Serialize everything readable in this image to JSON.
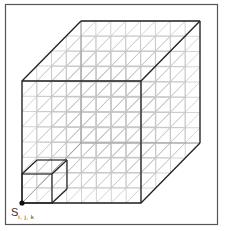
{
  "diagram": {
    "grid": {
      "nx": 8,
      "ny": 8,
      "nz": 4,
      "cell_px": 15
    },
    "outer_cube": {
      "front_face": {
        "x0": 22,
        "y0": 81,
        "x1": 141,
        "y1": 203
      },
      "depth_offset": {
        "dx": 59,
        "dy": -60
      }
    },
    "highlighted_cell": {
      "front_face": {
        "x0": 22,
        "y0": 174,
        "x1": 52,
        "y1": 203
      },
      "depth_offset": {
        "dx": 15,
        "dy": -14
      }
    },
    "origin_point": {
      "x": 22,
      "y": 203
    },
    "label": {
      "main": "S",
      "subscript": "i, j, k"
    },
    "colors": {
      "frame": "#555555",
      "edges": "#222222",
      "grid": "#c8c8c8",
      "hidden_edges": "#9a9a9a",
      "background": "#ffffff"
    }
  }
}
